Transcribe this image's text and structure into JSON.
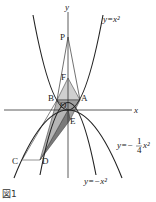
{
  "figure": {
    "caption": "図1",
    "axes": {
      "x_label": "x",
      "y_label": "y"
    },
    "curves": [
      {
        "id": "c1",
        "label": "y=x²",
        "eq": "y = x^2"
      },
      {
        "id": "c2",
        "label_prefix": "y=−",
        "label_num": "1",
        "label_den": "4",
        "label_suffix": "x²",
        "eq": "y = -1/4 x^2"
      },
      {
        "id": "c3",
        "label": "y=−x²",
        "eq": "y = -x^2"
      }
    ],
    "points": {
      "P": "P",
      "F": "F",
      "A": "A",
      "B": "B",
      "O": "O",
      "E": "E",
      "C": "C",
      "D": "D"
    },
    "colors": {
      "curve": "#222222",
      "axis": "#333333",
      "shade_light": "#c8c8c8",
      "shade_dark": "#8a8a8a",
      "segment_cd": "#888888"
    }
  }
}
